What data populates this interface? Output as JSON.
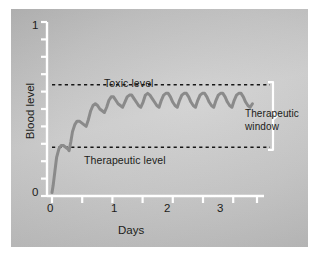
{
  "figure": {
    "background_color": "#c4c4c4",
    "frame_color": "#ffffff"
  },
  "axes": {
    "line_color": "#ffffff",
    "y_title": "Blood level",
    "x_title": "Days",
    "y_tick_labels": {
      "top": "1",
      "bottom": "0"
    },
    "x_tick_labels": [
      "0",
      "1",
      "2",
      "3"
    ]
  },
  "annotations": {
    "toxic": "Toxic level",
    "therapeutic": "Therapeutic level",
    "window_line1": "Therapeutic",
    "window_line2": "window"
  },
  "chart_data": {
    "type": "line",
    "title": "",
    "subtitle": "",
    "xlabel": "Days",
    "ylabel": "Blood level",
    "xlim": [
      0,
      3.6
    ],
    "ylim": [
      0,
      1
    ],
    "grid": false,
    "legend": "none",
    "x_ticks": [
      0,
      0.5,
      1,
      1.5,
      2,
      2.5,
      3,
      3.5
    ],
    "x_tick_labels": [
      "0",
      "",
      "1",
      "",
      "2",
      "",
      "3",
      ""
    ],
    "y_ticks": [
      0,
      0.1,
      0.2,
      0.3,
      0.4,
      0.5,
      0.6,
      0.7,
      0.8,
      0.9,
      1
    ],
    "y_tick_labels": [
      "0",
      "",
      "",
      "",
      "",
      "",
      "",
      "",
      "",
      "",
      "1"
    ],
    "series": [
      {
        "name": "Drug blood concentration",
        "color": "#8a8a8a",
        "line_width": 3,
        "description": "Repeated dosing curve: steep initial rise, oscillating peaks and troughs that climb to a steady state between the therapeutic and toxic levels",
        "x": [
          0.0,
          0.02,
          0.05,
          0.08,
          0.12,
          0.16,
          0.2,
          0.24,
          0.28,
          0.3,
          0.33,
          0.36,
          0.4,
          0.44,
          0.48,
          0.52,
          0.56,
          0.6,
          0.64,
          0.68,
          0.72,
          0.76,
          0.8,
          0.84,
          0.88,
          0.92,
          0.96,
          1.0,
          1.04,
          1.08,
          1.12,
          1.16,
          1.2,
          1.24,
          1.28,
          1.32,
          1.36,
          1.4,
          1.44,
          1.48,
          1.52,
          1.56,
          1.6,
          1.64,
          1.68,
          1.72,
          1.76,
          1.8,
          1.84,
          1.88,
          1.92,
          1.96,
          2.0,
          2.04,
          2.08,
          2.12,
          2.16,
          2.2,
          2.24,
          2.28,
          2.32,
          2.36,
          2.4,
          2.44,
          2.48,
          2.52,
          2.56,
          2.6,
          2.64,
          2.68,
          2.72,
          2.76,
          2.8,
          2.84,
          2.88,
          2.92,
          2.96,
          3.0,
          3.04,
          3.08,
          3.12,
          3.16,
          3.2,
          3.24,
          3.28,
          3.32,
          3.36,
          3.4,
          3.44,
          3.48,
          3.52
        ],
        "y": [
          0.02,
          0.06,
          0.14,
          0.22,
          0.27,
          0.29,
          0.29,
          0.28,
          0.27,
          0.26,
          0.31,
          0.37,
          0.41,
          0.43,
          0.43,
          0.42,
          0.41,
          0.4,
          0.44,
          0.49,
          0.52,
          0.53,
          0.52,
          0.5,
          0.49,
          0.48,
          0.51,
          0.55,
          0.57,
          0.57,
          0.55,
          0.53,
          0.52,
          0.51,
          0.54,
          0.57,
          0.58,
          0.58,
          0.56,
          0.54,
          0.52,
          0.51,
          0.54,
          0.58,
          0.59,
          0.58,
          0.56,
          0.54,
          0.52,
          0.51,
          0.55,
          0.58,
          0.59,
          0.59,
          0.57,
          0.54,
          0.52,
          0.51,
          0.55,
          0.58,
          0.59,
          0.59,
          0.57,
          0.54,
          0.52,
          0.51,
          0.55,
          0.58,
          0.59,
          0.59,
          0.57,
          0.54,
          0.52,
          0.51,
          0.55,
          0.58,
          0.59,
          0.59,
          0.57,
          0.54,
          0.52,
          0.51,
          0.55,
          0.58,
          0.59,
          0.59,
          0.57,
          0.54,
          0.52,
          0.51,
          0.53
        ]
      }
    ],
    "reference_lines": [
      {
        "name": "toxic-level",
        "label": "Toxic level",
        "y": 0.64,
        "style": "dashed",
        "color": "#161616",
        "x_start": 0.0,
        "x_end": 3.62
      },
      {
        "name": "therapeutic-level",
        "label": "Therapeutic level",
        "y": 0.28,
        "style": "dashed",
        "color": "#161616",
        "x_start": 0.0,
        "x_end": 3.62
      }
    ],
    "bracket": {
      "label": "Therapeutic window",
      "y_top": 0.64,
      "y_bottom": 0.28,
      "x": 3.68,
      "color": "#ffffff"
    }
  }
}
